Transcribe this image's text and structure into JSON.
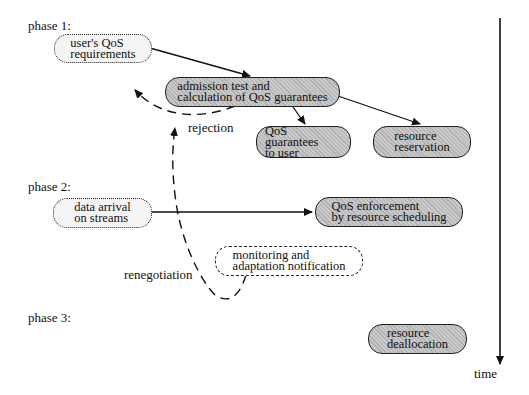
{
  "diagram": {
    "phases": [
      {
        "label": "phase 1:"
      },
      {
        "label": "phase 2:"
      },
      {
        "label": "phase 3:"
      }
    ],
    "nodes": {
      "user_qos": {
        "line1": "user's QoS",
        "line2": "requirements",
        "style": "dotted"
      },
      "admission": {
        "line1": "admission test and",
        "line2": "calculation of QoS guarantees",
        "style": "shaded"
      },
      "qos_guarantees": {
        "line1": "QoS guarantees",
        "line2": "to user",
        "style": "shaded"
      },
      "resource_reservation": {
        "line1": "resource",
        "line2": "reservation",
        "style": "shaded"
      },
      "data_arrival": {
        "line1": "data arrival",
        "line2": "on streams",
        "style": "dotted"
      },
      "enforcement": {
        "line1": "QoS enforcement",
        "line2": "by resource scheduling",
        "style": "shaded"
      },
      "monitoring": {
        "line1": "monitoring and",
        "line2": "adaptation notification",
        "style": "dashed"
      },
      "deallocation": {
        "line1": "resource",
        "line2": "deallocation",
        "style": "shaded"
      }
    },
    "edge_labels": {
      "rejection": "rejection",
      "renegotiation": "renegotiation"
    },
    "axis": {
      "label": "time"
    },
    "edges": [
      {
        "from": "user_qos",
        "to": "admission",
        "style": "solid"
      },
      {
        "from": "admission",
        "to": "qos_guarantees",
        "style": "solid"
      },
      {
        "from": "admission",
        "to": "resource_reservation",
        "style": "solid"
      },
      {
        "from": "admission",
        "to": "user_qos",
        "style": "dashed",
        "label": "rejection"
      },
      {
        "from": "data_arrival",
        "to": "enforcement",
        "style": "solid"
      },
      {
        "from": "monitoring",
        "to": "user_qos",
        "style": "dashed",
        "label": "renegotiation"
      }
    ]
  }
}
